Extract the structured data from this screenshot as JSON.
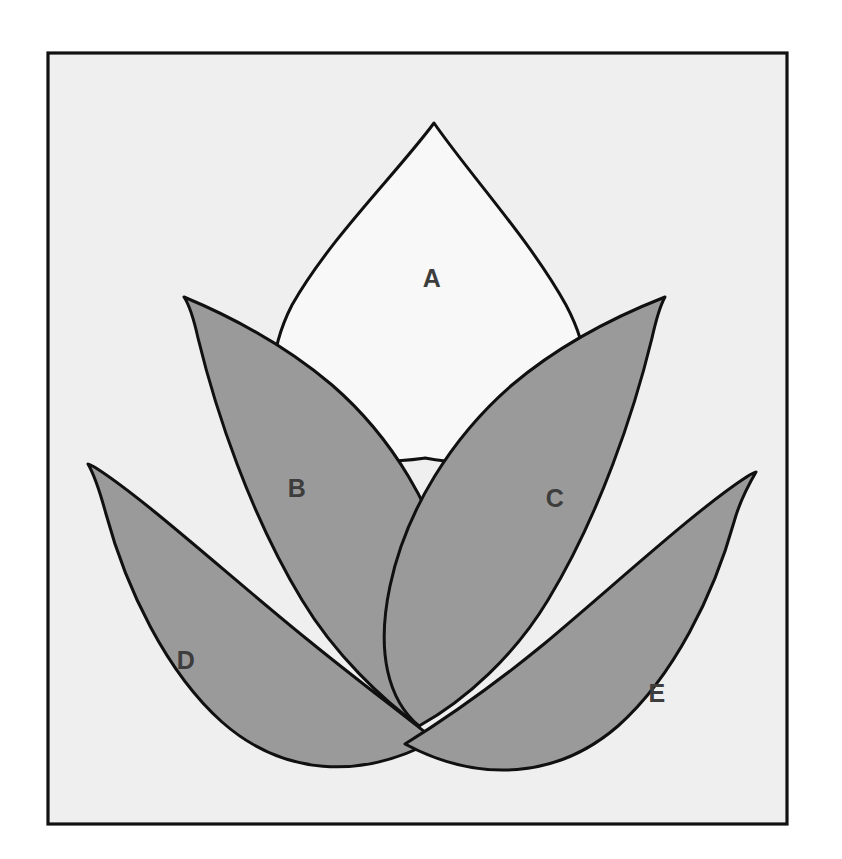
{
  "figure": {
    "kind": "lotus-petal-diagram",
    "canvas": {
      "width": 842,
      "height": 859
    },
    "page_background": "#ffffff",
    "frame": {
      "name": "outer-frame",
      "x": 48,
      "y": 53,
      "width": 739,
      "height": 771,
      "fill": "#efefef",
      "stroke": "#111111",
      "stroke_width": 3.2
    },
    "colors": {
      "shaded_petal_fill": "#9a9a9a",
      "open_petal_fill": "#f8f8f8",
      "outline": "#101010",
      "label_text": "#3d3d3d",
      "inner_background": "#efefef",
      "page_background": "#ffffff"
    },
    "petals": [
      {
        "id": "petal-a",
        "label": "A",
        "style": "open",
        "fill": "#f8f8f8",
        "label_x": 432,
        "label_y": 280,
        "apex_x": 434,
        "apex_y": 123,
        "base_x": 425,
        "base_y": 458,
        "path": "M 434 123 C 470 175 530 240 566 305 C 590 350 594 395 566 424 C 520 470 455 464 425 458 C 395 462 340 470 295 430 C 266 402 268 352 292 305 C 330 238 397 173 434 123 Z"
      },
      {
        "id": "petal-b",
        "label": "B",
        "style": "shaded",
        "fill": "#9a9a9a",
        "label_x": 297,
        "label_y": 490,
        "tip_x": 184,
        "tip_y": 297,
        "base_x": 419,
        "base_y": 726,
        "path": "M 184 297 C 232 317 286 346 332 385 C 392 437 436 510 452 586 C 466 652 452 700 419 726 C 383 700 335 655 302 600 C 250 514 216 412 198 338 C 194 320 190 306 184 297 Z"
      },
      {
        "id": "petal-c",
        "label": "C",
        "style": "shaded",
        "fill": "#9a9a9a",
        "label_x": 555,
        "label_y": 500,
        "tip_x": 665,
        "tip_y": 297,
        "base_x": 419,
        "base_y": 726,
        "path": "M 665 297 C 660 306 656 320 652 338 C 634 412 600 514 548 600 C 515 655 466 700 419 726 C 388 700 376 652 390 586 C 406 510 452 437 512 385 C 558 346 614 317 665 297 Z"
      },
      {
        "id": "petal-d",
        "label": "D",
        "style": "shaded",
        "fill": "#9a9a9a",
        "label_x": 186,
        "label_y": 662,
        "tip_x": 88,
        "tip_y": 464,
        "base_x": 435,
        "base_y": 740,
        "path": "M 88 464 C 95 476 100 492 106 514 C 126 588 166 672 222 722 C 282 775 360 781 435 740 C 400 712 352 676 308 640 C 230 577 146 500 96 468 C 93 466 90 465 88 464 Z"
      },
      {
        "id": "petal-e",
        "label": "E",
        "style": "shaded",
        "fill": "#9a9a9a",
        "label_x": 657,
        "label_y": 695,
        "tip_x": 756,
        "tip_y": 472,
        "base_x": 405,
        "base_y": 744,
        "path": "M 756 472 C 754 473 751 474 748 476 C 698 508 618 582 544 644 C 500 680 450 716 405 744 C 480 784 558 778 618 726 C 674 676 714 594 734 522 C 740 500 749 484 756 472 Z"
      }
    ],
    "label_font": {
      "size": 25,
      "weight": "bold",
      "color": "#3d3d3d"
    },
    "labels_order": [
      "A",
      "B",
      "C",
      "D",
      "E"
    ]
  }
}
